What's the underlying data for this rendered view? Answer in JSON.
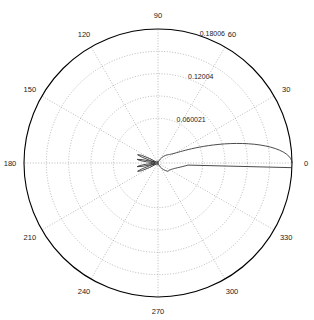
{
  "figure": {
    "type": "polar-plot",
    "background_color": "#ffffff",
    "grid_color": "#8c8c8c",
    "axis_color": "#000000",
    "curve_color": "#2b2b2b"
  },
  "chart_data": {
    "type": "line",
    "subtype": "polar",
    "title": "",
    "xlabel": "",
    "ylabel": "",
    "grid": true,
    "legend": null,
    "theta_unit": "degrees",
    "theta_direction": "counterclockwise",
    "theta_zero_location": "E",
    "angle_ticks": [
      0,
      30,
      60,
      90,
      120,
      150,
      180,
      210,
      240,
      270,
      300,
      330
    ],
    "angle_tick_labels": [
      "0",
      "30",
      "60",
      "90",
      "120",
      "150",
      "180",
      "210",
      "240",
      "270",
      "300",
      "330"
    ],
    "radial_ticks": [
      0.060021,
      0.12004,
      0.18006
    ],
    "radial_tick_labels": [
      "0.060021",
      "0.12004",
      "0.18006"
    ],
    "rlim": [
      0,
      0.18006
    ],
    "radial_label_angle": 75,
    "series": [
      {
        "name": "radiation pattern",
        "description": "narrow main lobe along 0 degrees with small sidelobes near the origin",
        "theta": [
          0,
          1,
          2,
          3,
          4,
          5,
          6,
          7,
          8,
          9,
          10,
          11,
          12,
          13,
          14,
          15,
          16,
          17,
          18,
          19,
          20,
          21,
          22,
          23,
          24,
          25,
          26,
          27,
          28,
          29,
          30,
          31,
          32,
          33,
          34,
          35,
          36,
          37,
          38,
          39,
          40,
          45,
          50,
          55,
          60,
          65,
          70,
          75,
          80,
          85,
          90,
          95,
          100,
          105,
          110,
          115,
          120,
          125,
          130,
          135,
          140,
          145,
          148,
          150,
          152,
          155,
          158,
          160,
          162,
          164,
          166,
          168,
          170,
          172,
          174,
          176,
          178,
          180,
          182,
          184,
          186,
          188,
          190,
          192,
          194,
          196,
          198,
          200,
          202,
          205,
          208,
          210,
          212,
          215,
          220,
          225,
          230,
          235,
          240,
          245,
          250,
          255,
          260,
          265,
          270,
          275,
          280,
          285,
          290,
          295,
          300,
          305,
          310,
          315,
          320,
          325,
          330,
          332,
          334,
          336,
          338,
          340,
          342,
          344,
          346,
          348,
          350,
          352,
          354,
          356,
          358,
          360
        ],
        "r": [
          0.18006,
          0.1796,
          0.17824,
          0.176,
          0.1729,
          0.16898,
          0.1643,
          0.15892,
          0.1529,
          0.14634,
          0.13932,
          0.13194,
          0.1243,
          0.1165,
          0.10864,
          0.10082,
          0.09314,
          0.08568,
          0.07852,
          0.07172,
          0.06532,
          0.05936,
          0.05388,
          0.04888,
          0.04436,
          0.04034,
          0.03678,
          0.03366,
          0.03096,
          0.02864,
          0.02666,
          0.02498,
          0.02356,
          0.02236,
          0.02134,
          0.02046,
          0.0197,
          0.01902,
          0.0184,
          0.01782,
          0.01726,
          0.01456,
          0.0117,
          0.00878,
          0.00606,
          0.0038,
          0.00216,
          0.0012,
          0.0009,
          0.0011,
          0.0016,
          0.0021,
          0.00248,
          0.00268,
          0.0027,
          0.00256,
          0.0023,
          0.00196,
          0.00162,
          0.00134,
          0.00118,
          0.0014,
          0.0028,
          0.0052,
          0.0126,
          0.0248,
          0.0296,
          0.0226,
          0.011,
          0.0042,
          0.0098,
          0.0218,
          0.0284,
          0.0252,
          0.0158,
          0.007,
          0.0028,
          0.0018,
          0.0026,
          0.007,
          0.0158,
          0.0252,
          0.0284,
          0.0218,
          0.0098,
          0.0042,
          0.011,
          0.0226,
          0.0296,
          0.0248,
          0.0126,
          0.0052,
          0.0028,
          0.0014,
          0.00118,
          0.00134,
          0.00162,
          0.00196,
          0.0023,
          0.00256,
          0.0027,
          0.00268,
          0.00248,
          0.0021,
          0.0016,
          0.0011,
          0.0009,
          0.0012,
          0.00216,
          0.0038,
          0.00606,
          0.00878,
          0.0117,
          0.01456,
          0.01726,
          0.01782,
          0.0184,
          0.01902,
          0.0197,
          0.02046,
          0.02134,
          0.02236,
          0.02356,
          0.02498,
          0.02666,
          0.02864,
          0.03096,
          0.03366,
          0.03678,
          0.04034,
          0.18006
        ]
      }
    ],
    "annotations": []
  },
  "labels": {
    "angles": [
      {
        "name": "angle-0",
        "text": "0"
      },
      {
        "name": "angle-30",
        "text": "30"
      },
      {
        "name": "angle-60",
        "text": "60"
      },
      {
        "name": "angle-90",
        "text": "90"
      },
      {
        "name": "angle-120",
        "text": "120"
      },
      {
        "name": "angle-150",
        "text": "150"
      },
      {
        "name": "angle-180",
        "text": "180"
      },
      {
        "name": "angle-210",
        "text": "210"
      },
      {
        "name": "angle-240",
        "text": "240"
      },
      {
        "name": "angle-270",
        "text": "270"
      },
      {
        "name": "angle-300",
        "text": "300"
      },
      {
        "name": "angle-330",
        "text": "330"
      }
    ],
    "radii": [
      {
        "name": "radial-inner",
        "text": "0.060021"
      },
      {
        "name": "radial-middle",
        "text": "0.12004"
      },
      {
        "name": "radial-outer",
        "text": "0.18006"
      }
    ]
  }
}
